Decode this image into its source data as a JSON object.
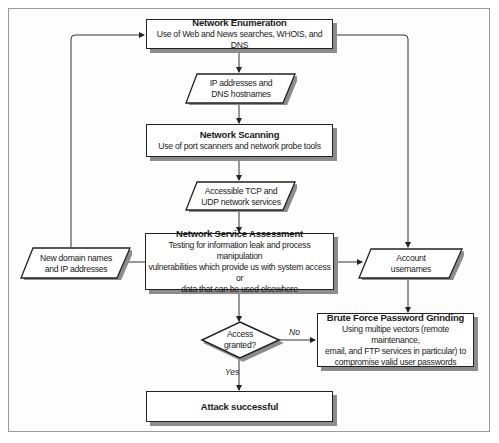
{
  "diagram": {
    "type": "flowchart",
    "nodes": {
      "network_enumeration": {
        "title": "Network Enumeration",
        "description": "Use of Web and News searches, WHOIS, and DNS"
      },
      "ip_dns": {
        "line1": "IP addresses and",
        "line2": "DNS hostnames"
      },
      "network_scanning": {
        "title": "Network Scanning",
        "description": "Use of port scanners and network probe tools"
      },
      "tcp_udp": {
        "line1": "Accessible TCP and",
        "line2": "UDP network services"
      },
      "network_service_assessment": {
        "title": "Network Service Assessment",
        "line1": "Testing for information leak and process manipulation",
        "line2": "vulnerabilities which provide us with system access or",
        "line3": "data that can be used elsewhere"
      },
      "new_domains": {
        "line1": "New domain names",
        "line2": "and IP addresses"
      },
      "account_usernames": {
        "line1": "Account",
        "line2": "usernames"
      },
      "access_granted": {
        "line1": "Access",
        "line2": "granted?"
      },
      "brute_force": {
        "title": "Brute Force Password Grinding",
        "line1": "Using multipe vectors (remote maintenance,",
        "line2": "email, and FTP services in particular) to",
        "line3": "compromise valid user passwords"
      },
      "attack_successful": {
        "title": "Attack successful"
      }
    },
    "edge_labels": {
      "no": "No",
      "yes": "Yes"
    },
    "edges": [
      {
        "from": "network_enumeration",
        "to": "ip_dns"
      },
      {
        "from": "ip_dns",
        "to": "network_scanning"
      },
      {
        "from": "network_scanning",
        "to": "tcp_udp"
      },
      {
        "from": "tcp_udp",
        "to": "network_service_assessment"
      },
      {
        "from": "network_service_assessment",
        "to": "new_domains"
      },
      {
        "from": "new_domains",
        "to": "network_enumeration"
      },
      {
        "from": "network_enumeration",
        "to": "account_usernames"
      },
      {
        "from": "network_service_assessment",
        "to": "account_usernames"
      },
      {
        "from": "network_service_assessment",
        "to": "access_granted"
      },
      {
        "from": "account_usernames",
        "to": "brute_force"
      },
      {
        "from": "access_granted",
        "to": "brute_force",
        "label": "No"
      },
      {
        "from": "access_granted",
        "to": "attack_successful",
        "label": "Yes"
      }
    ],
    "colors": {
      "line": "#333333",
      "shadow": "#8c8c8c",
      "frame": "#9a9a9a"
    }
  }
}
